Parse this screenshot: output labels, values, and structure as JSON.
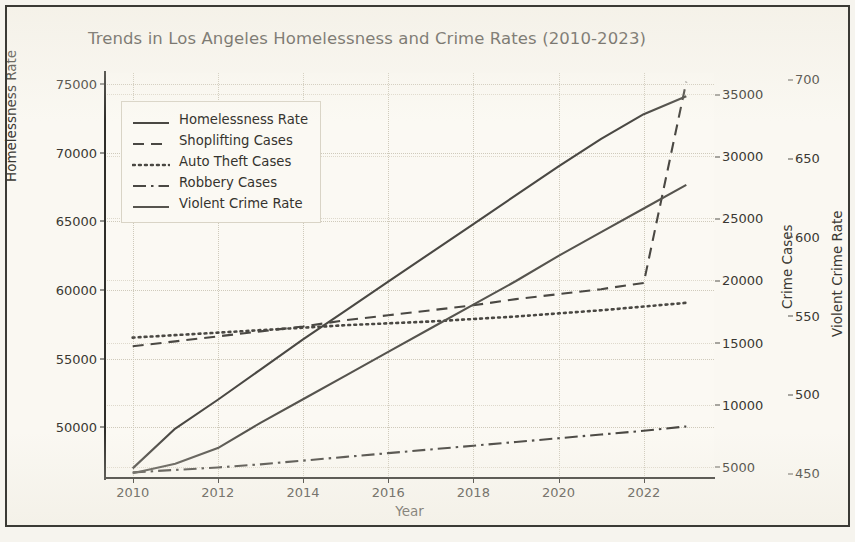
{
  "chart_data": {
    "type": "line",
    "title": "Trends in Los Angeles Homelessness and Crime Rates (2010-2023)",
    "xlabel": "Year",
    "ylabel": "Homelessness Rate",
    "ylabel_right_1": "Crime Cases",
    "ylabel_right_2": "Violent Crime Rate",
    "grid": true,
    "legend_position": "upper left",
    "x": [
      2010,
      2011,
      2012,
      2013,
      2014,
      2015,
      2016,
      2017,
      2018,
      2019,
      2020,
      2021,
      2022,
      2023
    ],
    "xlim": [
      2009.35,
      2023.65
    ],
    "xticks": [
      2010,
      2012,
      2014,
      2016,
      2018,
      2020,
      2022
    ],
    "ylim": [
      46300,
      75800
    ],
    "yticks": [
      50000,
      55000,
      60000,
      65000,
      70000,
      75000
    ],
    "ylim_crime": [
      4100,
      36700
    ],
    "yticks_crime": [
      5000,
      10000,
      15000,
      20000,
      25000,
      30000,
      35000
    ],
    "ylim_violent": [
      447,
      704
    ],
    "yticks_violent": [
      450,
      500,
      550,
      600,
      650,
      700
    ],
    "series": [
      {
        "name": "Homelessness Rate",
        "axis": "left",
        "linestyle": "solid",
        "color": "#4a4843",
        "values": [
          47000,
          49900,
          52000,
          54200,
          56400,
          58500,
          60600,
          62700,
          64800,
          66900,
          69000,
          71000,
          72800,
          74100
        ]
      },
      {
        "name": "Shoplifting Cases",
        "axis": "crime",
        "linestyle": "dashed",
        "color": "#4a4843",
        "values": [
          14700,
          15100,
          15500,
          15900,
          16300,
          16800,
          17200,
          17600,
          18000,
          18500,
          18900,
          19300,
          19800,
          36000
        ]
      },
      {
        "name": "Auto Theft Cases",
        "axis": "crime",
        "linestyle": "dotted",
        "color": "#4a4843",
        "values": [
          15400,
          15600,
          15800,
          16000,
          16200,
          16400,
          16550,
          16700,
          16900,
          17100,
          17350,
          17600,
          17900,
          18200
        ]
      },
      {
        "name": "Robbery Cases",
        "axis": "crime",
        "linestyle": "dashdot",
        "color": "#4a4843",
        "values": [
          4550,
          4750,
          4950,
          5200,
          5500,
          5800,
          6100,
          6400,
          6700,
          7000,
          7300,
          7600,
          7900,
          8250
        ]
      },
      {
        "name": "Violent Crime Rate",
        "axis": "violent",
        "linestyle": "solid",
        "color": "#56544e",
        "values": [
          450,
          456,
          466,
          482,
          497,
          512,
          527,
          542,
          557,
          572,
          588,
          603,
          618,
          633
        ]
      }
    ]
  },
  "axis": {
    "left_ticks": [
      "50000",
      "55000",
      "60000",
      "65000",
      "70000",
      "75000"
    ],
    "crime_ticks": [
      "5000",
      "10000",
      "15000",
      "20000",
      "25000",
      "30000",
      "35000"
    ],
    "violent_ticks": [
      "450",
      "500",
      "550",
      "600",
      "650",
      "700"
    ],
    "x_ticks": [
      "2010",
      "2012",
      "2014",
      "2016",
      "2018",
      "2020",
      "2022"
    ]
  },
  "legend": {
    "items": [
      {
        "label": "Homelessness Rate"
      },
      {
        "label": "Shoplifting Cases"
      },
      {
        "label": "Auto Theft Cases"
      },
      {
        "label": "Robbery Cases"
      },
      {
        "label": "Violent Crime Rate"
      }
    ]
  },
  "colors": {
    "background": "#faf8f2",
    "plot_background": "#fbf9f3",
    "line": "#4a4843",
    "grid": "#cfcabb",
    "text": "#35332e",
    "frame": "#3b3a35"
  }
}
